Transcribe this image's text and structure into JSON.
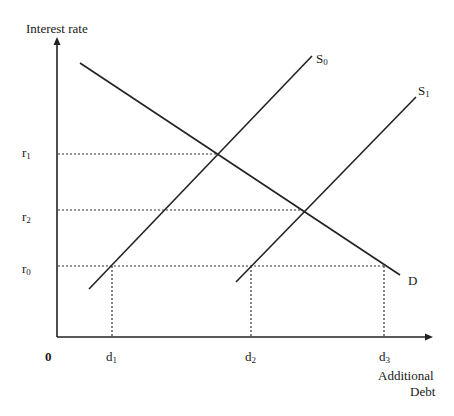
{
  "diagram": {
    "type": "supply-demand",
    "y_axis_label": "Interest rate",
    "x_axis_label_line1": "Additional",
    "x_axis_label_line2": "Debt",
    "origin_label": "0",
    "curves": [
      {
        "name": "S",
        "sub": "0",
        "from": [
          89,
          289
        ],
        "to": [
          312,
          56
        ]
      },
      {
        "name": "S",
        "sub": "1",
        "from": [
          236,
          282
        ],
        "to": [
          416,
          97
        ]
      },
      {
        "name": "D",
        "sub": "",
        "from": [
          80,
          63
        ],
        "to": [
          400,
          275
        ]
      }
    ],
    "y_levels": [
      {
        "name": "r",
        "sub": "1",
        "y": 154,
        "x_end": 219
      },
      {
        "name": "r",
        "sub": "2",
        "y": 210,
        "x_end": 303
      },
      {
        "name": "r",
        "sub": "0",
        "y": 266,
        "x_end": 384
      }
    ],
    "x_levels": [
      {
        "name": "d",
        "sub": "1",
        "x": 112
      },
      {
        "name": "d",
        "sub": "2",
        "x": 251
      },
      {
        "name": "d",
        "sub": "3",
        "x": 384
      }
    ]
  }
}
